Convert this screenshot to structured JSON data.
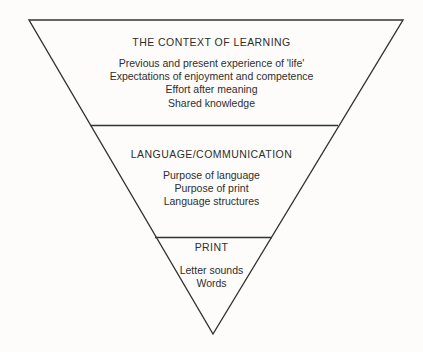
{
  "diagram": {
    "name": "inverted-triangle-model-of-reading",
    "shape": "inverted-triangle",
    "line_color": "#333333",
    "background_color": "#fdfcfa",
    "text_color": "#2e2e2e",
    "layers": [
      {
        "id": "context",
        "title": "THE CONTEXT OF LEARNING",
        "items": [
          "Previous and present experience of 'life'",
          "Expectations of enjoyment and competence",
          "Effort after meaning",
          "Shared knowledge"
        ]
      },
      {
        "id": "language",
        "title": "LANGUAGE/COMMUNICATION",
        "items": [
          "Purpose of language",
          "Purpose of print",
          "Language structures"
        ]
      },
      {
        "id": "print",
        "title": "PRINT",
        "items": [
          "Letter sounds",
          "Words"
        ]
      }
    ]
  }
}
